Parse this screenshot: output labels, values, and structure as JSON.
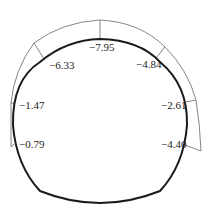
{
  "diagram": {
    "type": "tunnel-cross-section-pressure-distribution",
    "colors": {
      "lining": "#1a1a1a",
      "envelope": "#777777",
      "text": "#222222"
    },
    "points": [
      {
        "id": "crown",
        "label": "−7.95",
        "value": -7.95
      },
      {
        "id": "left-shoulder",
        "label": "−6.33",
        "value": -6.33
      },
      {
        "id": "right-shoulder",
        "label": "−4.84",
        "value": -4.84
      },
      {
        "id": "left-wall-upper",
        "label": "−1.47",
        "value": -1.47
      },
      {
        "id": "left-wall-lower",
        "label": "−0.79",
        "value": -0.79
      },
      {
        "id": "right-wall-upper",
        "label": "−2.61",
        "value": -2.61
      },
      {
        "id": "right-wall-lower",
        "label": "−4.40",
        "value": -4.4
      }
    ]
  }
}
